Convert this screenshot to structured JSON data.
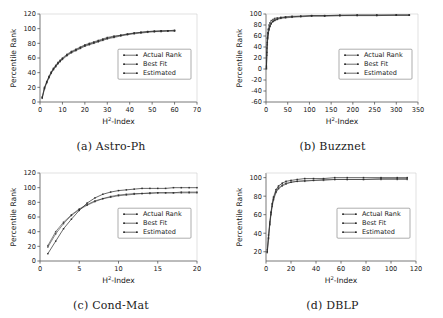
{
  "figure": {
    "panel_count": 4,
    "legend_labels": [
      "Actual Rank",
      "Best Fit",
      "Estimated"
    ]
  },
  "panels": [
    {
      "caption": "(a) Astro-Ph",
      "caption_letter": "(a)",
      "caption_name": "Astro-Ph"
    },
    {
      "caption": "(b) Buzznet",
      "caption_letter": "(b)",
      "caption_name": "Buzznet"
    },
    {
      "caption": "(c) Cond-Mat",
      "caption_letter": "(c)",
      "caption_name": "Cond-Mat"
    },
    {
      "caption": "(d) DBLP",
      "caption_letter": "(d)",
      "caption_name": "DBLP"
    }
  ],
  "legend": {
    "actual_rank": "Actual Rank",
    "best_fit": "Best Fit",
    "estimated": "Estimated"
  },
  "axis_titles": {
    "x_base": "H",
    "x_sup": "2",
    "x_suffix": "-Index",
    "y": "Percentile Rank"
  },
  "chart_data": [
    {
      "type": "scatter",
      "title": "(a) Astro-Ph",
      "xlabel": "H2-Index",
      "ylabel": "Percentile Rank",
      "xlim": [
        0,
        70
      ],
      "ylim": [
        0,
        120
      ],
      "xticks": [
        0,
        10,
        20,
        30,
        40,
        50,
        60,
        70
      ],
      "yticks": [
        0,
        20,
        40,
        60,
        80,
        100,
        120
      ],
      "grid": false,
      "legend_position": "center-right",
      "series": [
        {
          "name": "Actual Rank",
          "x": [
            1,
            2,
            3,
            4,
            5,
            6,
            7,
            8,
            9,
            10,
            12,
            14,
            16,
            18,
            20,
            22,
            24,
            26,
            28,
            30,
            33,
            36,
            39,
            42,
            45,
            48,
            51,
            54,
            57,
            60
          ],
          "y": [
            6,
            19,
            27,
            34,
            40,
            45,
            49,
            53,
            56,
            59,
            64,
            68,
            71,
            74,
            77,
            79,
            81,
            83,
            85,
            87,
            89,
            91,
            92,
            94,
            95,
            96,
            96,
            97,
            97,
            97
          ]
        },
        {
          "name": "Best Fit",
          "x": [
            1,
            2,
            3,
            4,
            5,
            6,
            7,
            8,
            9,
            10,
            12,
            14,
            16,
            18,
            20,
            22,
            24,
            26,
            28,
            30,
            33,
            36,
            39,
            42,
            45,
            48,
            51,
            54,
            57,
            60
          ],
          "y": [
            7,
            20,
            28,
            35,
            41,
            46,
            50,
            54,
            57,
            60,
            65,
            69,
            72,
            75,
            78,
            80,
            82,
            84,
            86,
            88,
            90,
            91,
            93,
            94,
            95,
            96,
            97,
            97,
            97,
            98
          ]
        },
        {
          "name": "Estimated",
          "x": [
            1,
            2,
            3,
            4,
            5,
            6,
            7,
            8,
            9,
            10,
            12,
            14,
            16,
            18,
            20,
            22,
            24,
            26,
            28,
            30,
            33,
            36,
            39,
            42,
            45,
            48,
            51,
            54,
            57,
            60
          ],
          "y": [
            5,
            18,
            26,
            33,
            39,
            44,
            48,
            52,
            55,
            58,
            63,
            67,
            70,
            73,
            76,
            78,
            80,
            82,
            84,
            86,
            88,
            90,
            92,
            93,
            94,
            95,
            96,
            96,
            97,
            97
          ]
        }
      ]
    },
    {
      "type": "scatter",
      "title": "(b) Buzznet",
      "xlabel": "H2-Index",
      "ylabel": "Percentile Rank",
      "xlim": [
        0,
        350
      ],
      "ylim": [
        -60,
        100
      ],
      "xticks": [
        0,
        50,
        100,
        150,
        200,
        250,
        300,
        350
      ],
      "yticks": [
        -60,
        -40,
        -20,
        0,
        20,
        40,
        60,
        80,
        100
      ],
      "grid": false,
      "legend_position": "center-right",
      "series": [
        {
          "name": "Actual Rank",
          "x": [
            1,
            2,
            3,
            4,
            5,
            7,
            9,
            12,
            16,
            20,
            26,
            34,
            45,
            60,
            80,
            105,
            135,
            170,
            210,
            255,
            300,
            330
          ],
          "y": [
            2,
            30,
            48,
            58,
            65,
            73,
            78,
            83,
            87,
            89,
            91,
            93,
            94,
            95,
            96,
            97,
            97,
            98,
            98,
            98,
            98,
            98
          ]
        },
        {
          "name": "Best Fit",
          "x": [
            1,
            2,
            3,
            4,
            5,
            7,
            9,
            12,
            16,
            20,
            26,
            34,
            45,
            60,
            80,
            105,
            135,
            170,
            210,
            255,
            300,
            330
          ],
          "y": [
            5,
            38,
            56,
            66,
            72,
            80,
            84,
            88,
            90,
            92,
            93,
            94,
            95,
            96,
            96,
            97,
            97,
            97,
            98,
            98,
            98,
            98
          ]
        },
        {
          "name": "Estimated",
          "x": [
            1,
            2,
            3,
            4,
            5,
            7,
            9,
            12,
            16,
            20,
            26,
            34,
            45,
            60,
            80,
            105,
            135,
            170,
            210,
            255,
            300,
            330
          ],
          "y": [
            0,
            25,
            44,
            55,
            62,
            71,
            77,
            82,
            86,
            88,
            90,
            92,
            93,
            94,
            95,
            96,
            96,
            97,
            97,
            97,
            98,
            98
          ]
        }
      ]
    },
    {
      "type": "scatter",
      "title": "(c) Cond-Mat",
      "xlabel": "H2-Index",
      "ylabel": "Percentile Rank",
      "xlim": [
        0,
        20
      ],
      "ylim": [
        0,
        120
      ],
      "xticks": [
        0,
        5,
        10,
        15,
        20
      ],
      "yticks": [
        0,
        20,
        40,
        60,
        80,
        100,
        120
      ],
      "grid": false,
      "legend_position": "center-right",
      "series": [
        {
          "name": "Actual Rank",
          "x": [
            1,
            2,
            3,
            4,
            5,
            6,
            7,
            8,
            9,
            10,
            11,
            12,
            13,
            14,
            15,
            16,
            17,
            18,
            19,
            20
          ],
          "y": [
            10,
            27,
            44,
            57,
            69,
            79,
            86,
            91,
            94,
            96,
            97,
            98,
            99,
            99,
            99,
            99,
            100,
            100,
            100,
            100
          ]
        },
        {
          "name": "Best Fit",
          "x": [
            1,
            2,
            3,
            4,
            5,
            6,
            7,
            8,
            9,
            10,
            11,
            12,
            13,
            14,
            15,
            16,
            17,
            18,
            19,
            20
          ],
          "y": [
            19,
            37,
            51,
            62,
            70,
            76,
            81,
            85,
            87,
            89,
            90,
            91,
            92,
            92,
            93,
            93,
            93,
            93,
            93,
            93
          ]
        },
        {
          "name": "Estimated",
          "x": [
            1,
            2,
            3,
            4,
            5,
            6,
            7,
            8,
            9,
            10,
            11,
            12,
            13,
            14,
            15,
            16,
            17,
            18,
            19,
            20
          ],
          "y": [
            21,
            40,
            53,
            63,
            71,
            77,
            82,
            85,
            88,
            90,
            91,
            92,
            92,
            93,
            93,
            93,
            93,
            94,
            94,
            94
          ]
        }
      ]
    },
    {
      "type": "scatter",
      "title": "(d) DBLP",
      "xlabel": "H2-Index",
      "ylabel": "Percentile Rank",
      "xlim": [
        0,
        120
      ],
      "ylim": [
        10,
        105
      ],
      "xticks": [
        0,
        20,
        40,
        60,
        80,
        100,
        120
      ],
      "yticks": [
        20,
        40,
        60,
        80,
        100
      ],
      "grid": false,
      "legend_position": "center-right",
      "series": [
        {
          "name": "Actual Rank",
          "x": [
            1,
            2,
            3,
            4,
            5,
            6,
            8,
            10,
            13,
            16,
            20,
            25,
            31,
            38,
            46,
            55,
            65,
            78,
            92,
            105,
            113
          ],
          "y": [
            20,
            35,
            50,
            62,
            72,
            79,
            87,
            91,
            94,
            96,
            97,
            98,
            99,
            99,
            99,
            100,
            100,
            100,
            100,
            100,
            100
          ]
        },
        {
          "name": "Best Fit",
          "x": [
            1,
            2,
            3,
            4,
            5,
            6,
            8,
            10,
            13,
            16,
            20,
            25,
            31,
            38,
            46,
            55,
            65,
            78,
            92,
            105,
            113
          ],
          "y": [
            22,
            38,
            52,
            63,
            71,
            77,
            85,
            89,
            92,
            94,
            95,
            96,
            97,
            97,
            98,
            98,
            98,
            98,
            99,
            99,
            99
          ]
        },
        {
          "name": "Estimated",
          "x": [
            1,
            2,
            3,
            4,
            5,
            6,
            8,
            10,
            13,
            16,
            20,
            25,
            31,
            38,
            46,
            55,
            65,
            78,
            92,
            105,
            113
          ],
          "y": [
            19,
            34,
            49,
            60,
            69,
            76,
            84,
            88,
            91,
            93,
            95,
            96,
            96,
            97,
            97,
            98,
            98,
            98,
            98,
            98,
            98
          ]
        }
      ]
    }
  ]
}
